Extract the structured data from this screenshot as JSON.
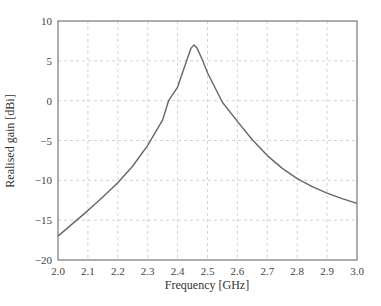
{
  "chart_data": {
    "type": "line",
    "title": "",
    "xlabel": "Frequency [GHz]",
    "ylabel": "Realised gain [dBi]",
    "xlim": [
      2.0,
      3.0
    ],
    "ylim": [
      -20,
      10
    ],
    "xticks": [
      "2.0",
      "2.1",
      "2.2",
      "2.3",
      "2.4",
      "2.5",
      "2.6",
      "2.7",
      "2.8",
      "2.9",
      "3.0"
    ],
    "yticks": [
      "10",
      "5",
      "0",
      "−5",
      "−10",
      "−15",
      "−20"
    ],
    "xtick_values": [
      2.0,
      2.1,
      2.2,
      2.3,
      2.4,
      2.5,
      2.6,
      2.7,
      2.8,
      2.9,
      3.0
    ],
    "ytick_values": [
      10,
      5,
      0,
      -5,
      -10,
      -15,
      -20
    ],
    "grid": true,
    "legend": null,
    "series": [
      {
        "name": "Realised gain",
        "color": "#666666",
        "x": [
          2.0,
          2.05,
          2.1,
          2.15,
          2.2,
          2.25,
          2.3,
          2.35,
          2.37,
          2.4,
          2.43,
          2.445,
          2.455,
          2.465,
          2.475,
          2.485,
          2.5,
          2.55,
          2.6,
          2.65,
          2.7,
          2.75,
          2.8,
          2.85,
          2.9,
          2.95,
          3.0
        ],
        "y": [
          -17.0,
          -15.4,
          -13.8,
          -12.1,
          -10.3,
          -8.2,
          -5.6,
          -2.4,
          0.0,
          1.7,
          5.0,
          6.6,
          7.0,
          6.6,
          5.8,
          4.9,
          3.5,
          -0.2,
          -2.6,
          -4.9,
          -6.9,
          -8.5,
          -9.8,
          -10.8,
          -11.6,
          -12.3,
          -12.9
        ]
      }
    ]
  },
  "colors": {
    "axis": "#777777",
    "grid": "#c8c8c8",
    "line": "#666666",
    "text": "#444444"
  }
}
